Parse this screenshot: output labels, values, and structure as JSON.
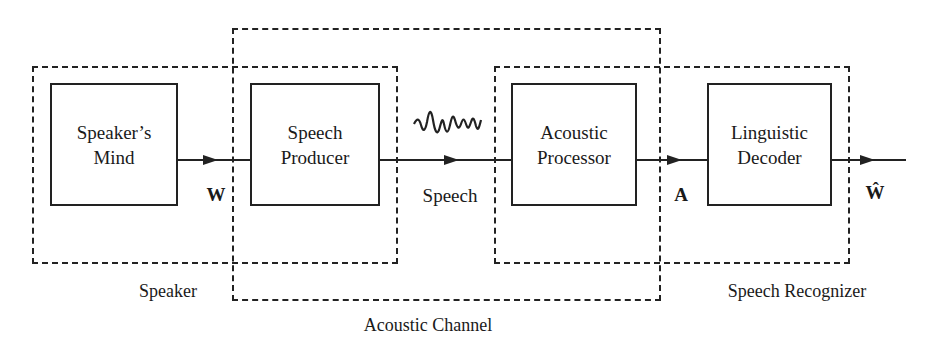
{
  "diagram": {
    "type": "block-diagram",
    "title": "",
    "groups": [
      {
        "id": "speaker",
        "label": "Speaker"
      },
      {
        "id": "acoustic_channel",
        "label": "Acoustic Channel"
      },
      {
        "id": "speech_recognizer",
        "label": "Speech Recognizer"
      }
    ],
    "blocks": [
      {
        "id": "speakers_mind",
        "label": "Speaker’s\nMind"
      },
      {
        "id": "speech_producer",
        "label": "Speech\nProducer"
      },
      {
        "id": "acoustic_processor",
        "label": "Acoustic\nProcessor"
      },
      {
        "id": "linguistic_decoder",
        "label": "Linguistic\nDecoder"
      }
    ],
    "signals": [
      {
        "id": "w",
        "label": "W"
      },
      {
        "id": "speech",
        "label": "Speech"
      },
      {
        "id": "a",
        "label": "A"
      },
      {
        "id": "w_hat",
        "label": "Ŵ"
      }
    ],
    "icons": {
      "waveform": "speech-waveform-icon"
    },
    "colors": {
      "stroke": "#222222",
      "background": "#ffffff"
    }
  }
}
